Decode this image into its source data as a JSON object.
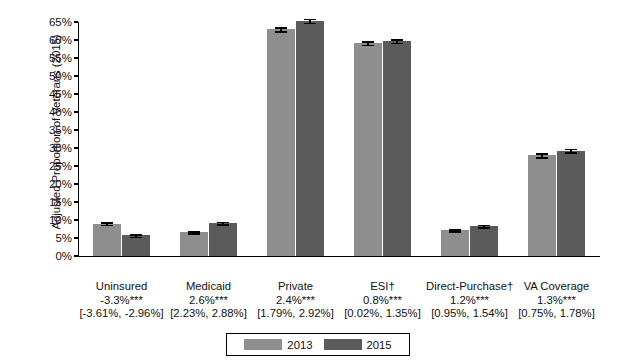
{
  "chart_data": {
    "type": "bar",
    "title": "",
    "xlabel": "",
    "ylabel": "Adjusted Proportion of Veterans (2015)",
    "ylim": [
      0,
      65
    ],
    "ytick_labels": [
      "0%",
      "5%",
      "10%",
      "15%",
      "20%",
      "25%",
      "30%",
      "35%",
      "40%",
      "45%",
      "50%",
      "55%",
      "60%",
      "65%"
    ],
    "ytick_values": [
      0,
      5,
      10,
      15,
      20,
      25,
      30,
      35,
      40,
      45,
      50,
      55,
      60,
      65
    ],
    "grid": false,
    "legend_position": "bottom-center",
    "categories": [
      "Uninsured",
      "Medicaid",
      "Private",
      "ESI†",
      "Direct-Purchase†",
      "VA Coverage"
    ],
    "series": [
      {
        "name": "2013",
        "color": "#8e8e8e",
        "values": [
          9.0,
          6.6,
          63.0,
          59.2,
          7.2,
          28.0
        ],
        "errors": [
          0.35,
          0.32,
          0.55,
          0.5,
          0.3,
          0.5
        ]
      },
      {
        "name": "2015",
        "color": "#5b5b5b",
        "values": [
          5.7,
          9.2,
          65.4,
          59.8,
          8.4,
          29.3
        ],
        "errors": [
          0.3,
          0.35,
          0.55,
          0.5,
          0.32,
          0.5
        ]
      }
    ],
    "annotations": {
      "deltas": [
        "-3.3%***",
        "2.6%***",
        "2.4%***",
        "0.8%***",
        "1.2%***",
        "1.3%***"
      ],
      "confidence_intervals": [
        "[-3.61%, -2.96%]",
        "[2.23%, 2.88%]",
        "[1.79%, 2.92%]",
        "[0.02%, 1.35%]",
        "[0.95%, 1.54%]",
        "[0.75%, 1.78%]"
      ]
    }
  },
  "legend": {
    "entries": [
      {
        "label": "2013",
        "color": "#8e8e8e"
      },
      {
        "label": "2015",
        "color": "#5b5b5b"
      }
    ]
  },
  "colors": {
    "series_2013": "#8e8e8e",
    "series_2015": "#5b5b5b",
    "axis": "#000000",
    "text": "#111111",
    "background": "#ffffff"
  }
}
